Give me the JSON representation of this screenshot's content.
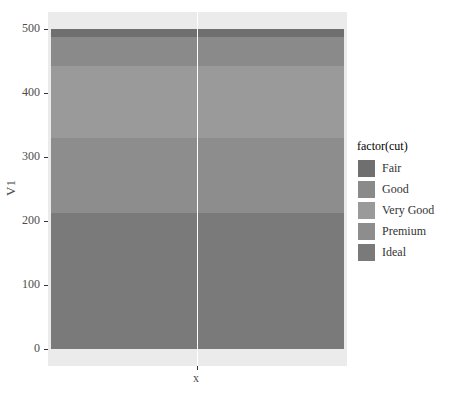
{
  "chart_data": {
    "type": "bar",
    "stacked": true,
    "title": "",
    "xlabel": "x",
    "ylabel": "V1",
    "categories": [
      ""
    ],
    "ylim": [
      0,
      500
    ],
    "yticks": [
      0,
      100,
      200,
      300,
      400,
      500
    ],
    "grid": true,
    "legend_position": "right",
    "legend_title": "factor(cut)",
    "series": [
      {
        "name": "Fair",
        "values": [
          12
        ],
        "color": "#6f6f6f"
      },
      {
        "name": "Good",
        "values": [
          46
        ],
        "color": "#8a8a8a"
      },
      {
        "name": "Very Good",
        "values": [
          113
        ],
        "color": "#9a9a9a"
      },
      {
        "name": "Premium",
        "values": [
          117
        ],
        "color": "#8d8d8d"
      },
      {
        "name": "Ideal",
        "values": [
          212
        ],
        "color": "#7a7a7a"
      }
    ]
  },
  "axis": {
    "y_labels": [
      "500",
      "400",
      "300",
      "200",
      "100",
      "0"
    ],
    "x_label": "x",
    "y_title": "V1"
  },
  "legend": {
    "title": "factor(cut)",
    "items": [
      {
        "label": "Fair",
        "color": "#6f6f6f"
      },
      {
        "label": "Good",
        "color": "#8a8a8a"
      },
      {
        "label": "Very Good",
        "color": "#9a9a9a"
      },
      {
        "label": "Premium",
        "color": "#8d8d8d"
      },
      {
        "label": "Ideal",
        "color": "#7a7a7a"
      }
    ]
  }
}
